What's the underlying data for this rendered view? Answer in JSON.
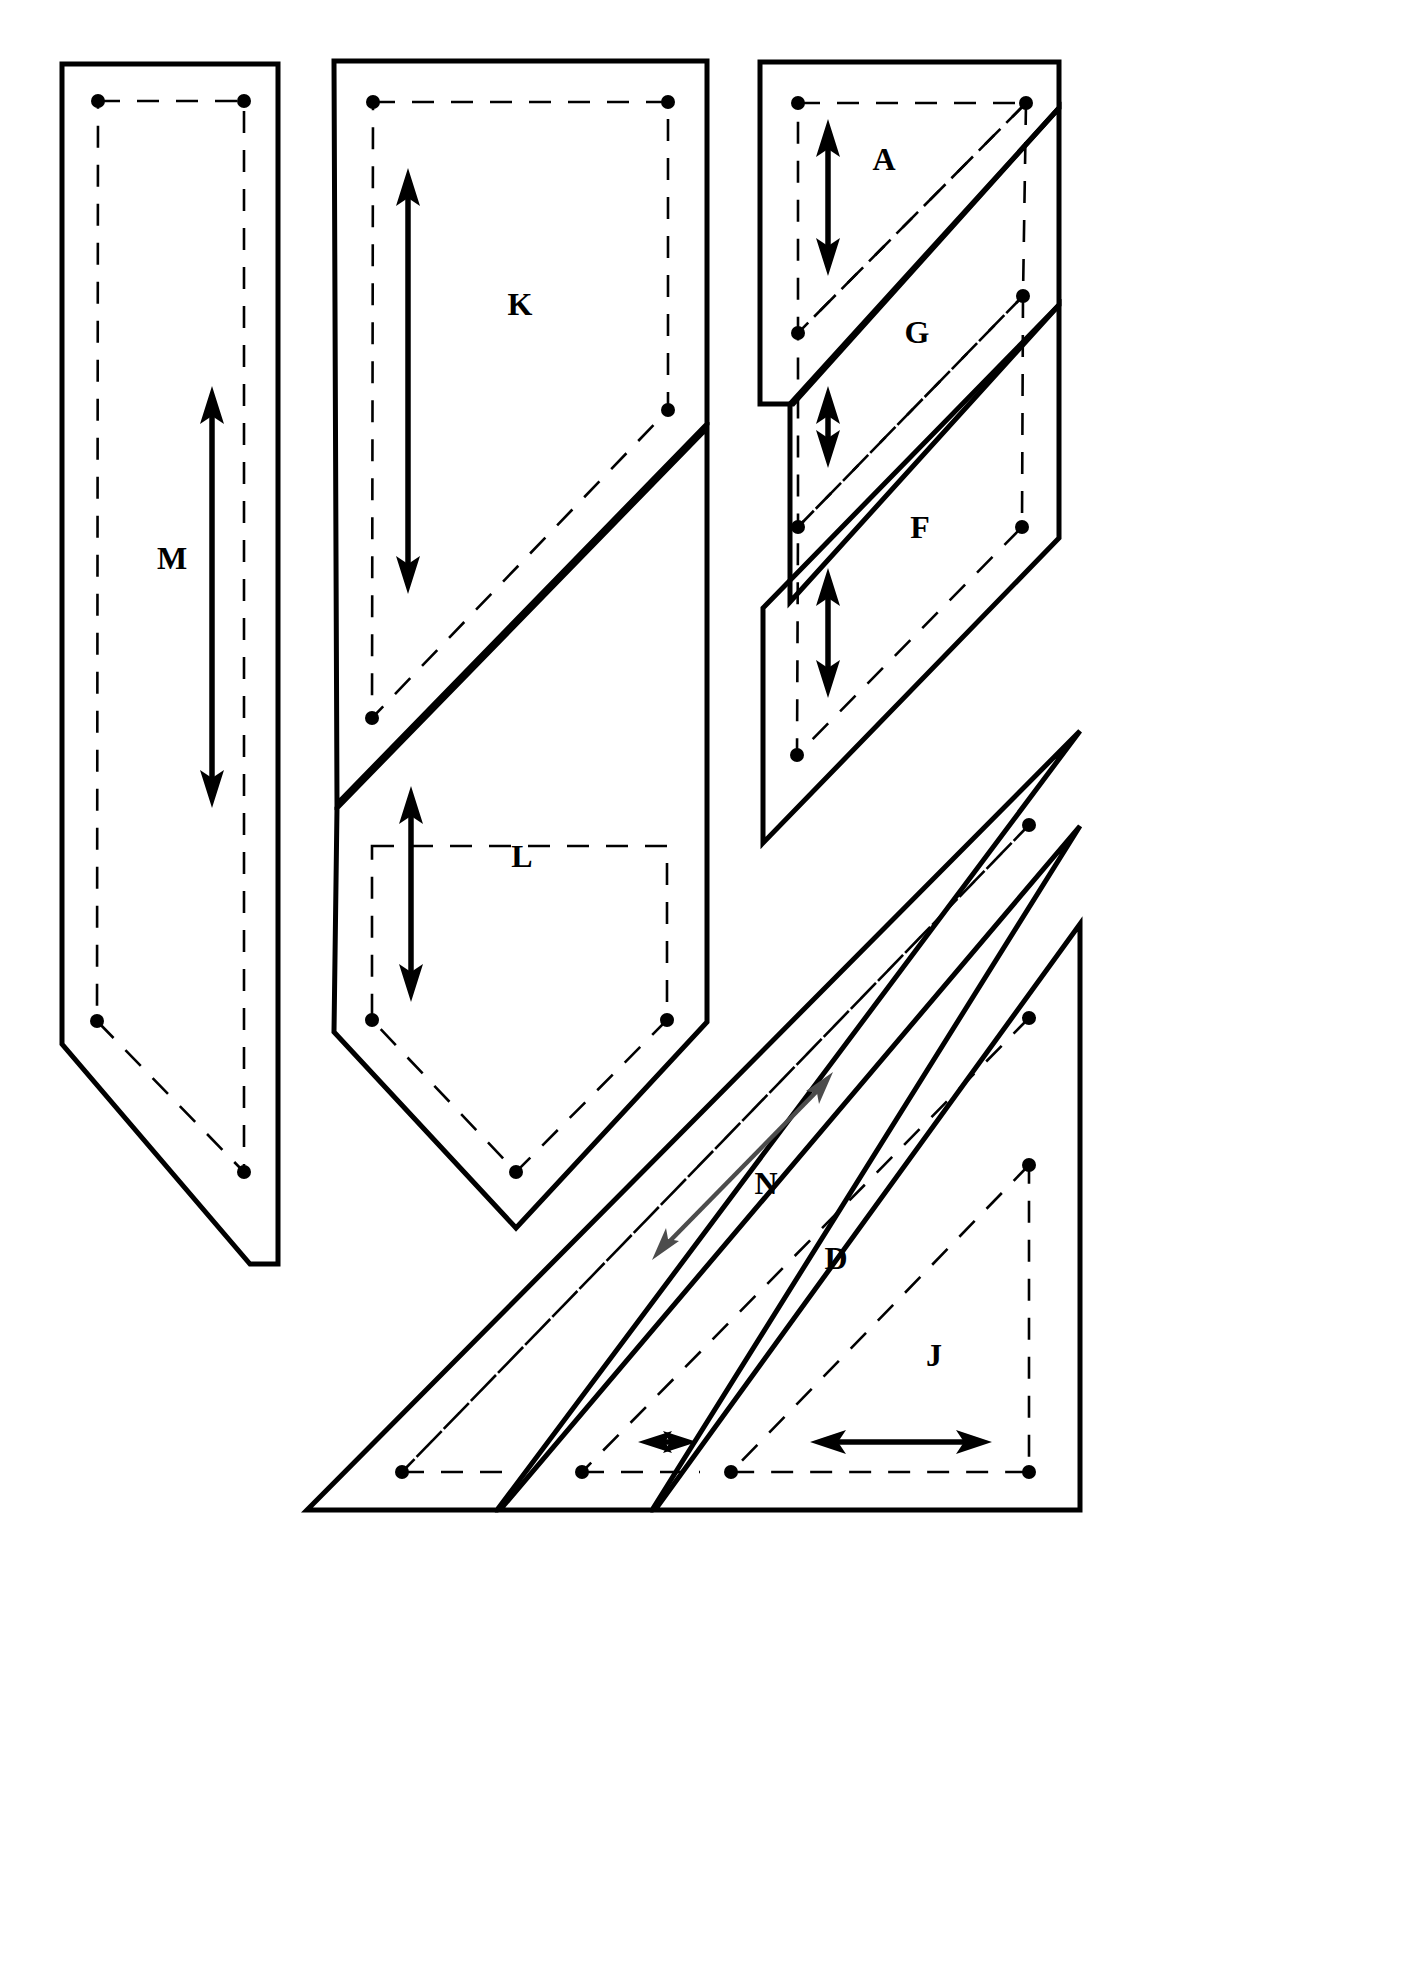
{
  "document": {
    "type": "sewing-pattern-sheet",
    "description": "Pattern piece layout sheet with cutting lines, dashed seam lines, pivot dots and grainline arrows",
    "background_color": "#ffffff",
    "ink_color": "#000000",
    "secondary_ink_color": "#4c4c4c"
  },
  "legend": {
    "cut_line": "solid heavy outline = cutting line",
    "seam_line": "dashed inner line = stitching / seam line",
    "dot": "filled circle = seam intersection / pivot point",
    "arrow": "double headed arrow = grainline direction"
  },
  "pieces": [
    {
      "id": "M",
      "label": "M",
      "label_x": 172,
      "label_y": 562,
      "group": "left-column",
      "grain": "vertical",
      "grain_arrow": {
        "x1": 212,
        "y1": 392,
        "x2": 212,
        "y2": 800,
        "heads": "both",
        "color": "#000000"
      }
    },
    {
      "id": "K",
      "label": "K",
      "label_x": 520,
      "label_y": 308,
      "group": "center-column",
      "grain": "vertical",
      "grain_arrow": {
        "x1": 408,
        "y1": 172,
        "x2": 408,
        "y2": 588,
        "heads": "both",
        "color": "#000000"
      }
    },
    {
      "id": "L",
      "label": "L",
      "label_x": 522,
      "label_y": 860,
      "group": "center-column",
      "grain": "vertical",
      "grain_arrow": {
        "x1": 411,
        "y1": 790,
        "x2": 411,
        "y2": 996,
        "heads": "both",
        "color": "#000000"
      }
    },
    {
      "id": "A",
      "label": "A",
      "label_x": 884,
      "label_y": 163,
      "group": "right-top-column",
      "grain": "vertical",
      "grain_arrow": {
        "x1": 828,
        "y1": 123,
        "x2": 828,
        "y2": 272,
        "heads": "both",
        "color": "#000000"
      }
    },
    {
      "id": "G",
      "label": "G",
      "label_x": 917,
      "label_y": 336,
      "group": "right-top-column",
      "grain": "vertical",
      "grain_arrow": {
        "x1": 828,
        "y1": 390,
        "x2": 828,
        "y2": 464,
        "heads": "both",
        "color": "#000000"
      }
    },
    {
      "id": "F",
      "label": "F",
      "label_x": 920,
      "label_y": 531,
      "group": "right-top-column",
      "grain": "vertical",
      "grain_arrow": {
        "x1": 828,
        "y1": 572,
        "x2": 828,
        "y2": 694,
        "heads": "both",
        "color": "#000000"
      }
    },
    {
      "id": "N",
      "label": "N",
      "label_x": 766,
      "label_y": 1187,
      "group": "bottom-right-triangles",
      "grain": "diagonal",
      "grain_arrow": {
        "x1": 654,
        "y1": 1257,
        "x2": 830,
        "y2": 1075,
        "heads": "both",
        "color": "#4c4c4c"
      }
    },
    {
      "id": "D",
      "label": "D",
      "label_x": 836,
      "label_y": 1262,
      "group": "bottom-right-triangles",
      "grain": "horizontal",
      "grain_arrow": {
        "x1": 643,
        "y1": 1442,
        "x2": 692,
        "y2": 1442,
        "heads": "both",
        "color": "#000000"
      }
    },
    {
      "id": "J",
      "label": "J",
      "label_x": 934,
      "label_y": 1359,
      "group": "bottom-right-triangles",
      "grain": "horizontal",
      "grain_arrow": {
        "x1": 816,
        "y1": 1442,
        "x2": 986,
        "y2": 1442,
        "heads": "both",
        "color": "#000000"
      }
    }
  ],
  "outlines": {
    "piece_M_cut": "M 62,64 L 278,64 L 278,1264 L 250,1264 L 62,1042 Z",
    "piece_M_seam": "M 98,101 L 244,101 L 244,1172 L 97,1021 Z",
    "piece_KL_cut_K": "M 334,61 L 707,61 L 707,424 L 337,804 L 334,61 Z",
    "piece_KL_cut_L": "M 337,806 L 707,426 L 707,1022 L 516,1228 L 334,1030 L 337,806 Z",
    "piece_K_seam": "M 373,102 L 668,102 L 668,410 L 372,718 Z",
    "piece_L_seam": "M 372,846 L 667,846 L 667,1020 L 516,1172 L 372,1020 Z",
    "piece_AGF_cut": "M 760,62 L 1059,62 L 1059,105 L 791,402 L 791,62 Z",
    "bottom_triangle_cut": "M 307,1510 L 1080,731 L 1080,1510 Z"
  },
  "dots": [
    {
      "x": 98,
      "y": 101
    },
    {
      "x": 244,
      "y": 101
    },
    {
      "x": 97,
      "y": 1021
    },
    {
      "x": 244,
      "y": 1172
    },
    {
      "x": 373,
      "y": 102
    },
    {
      "x": 668,
      "y": 102
    },
    {
      "x": 372,
      "y": 718
    },
    {
      "x": 668,
      "y": 410
    },
    {
      "x": 372,
      "y": 1020
    },
    {
      "x": 667,
      "y": 1020
    },
    {
      "x": 516,
      "y": 1172
    },
    {
      "x": 798,
      "y": 103
    },
    {
      "x": 1026,
      "y": 103
    },
    {
      "x": 798,
      "y": 333
    },
    {
      "x": 1023,
      "y": 296
    },
    {
      "x": 797,
      "y": 527
    },
    {
      "x": 1022,
      "y": 527
    },
    {
      "x": 797,
      "y": 755
    },
    {
      "x": 1029,
      "y": 825
    },
    {
      "x": 402,
      "y": 1472
    },
    {
      "x": 1029,
      "y": 1018
    },
    {
      "x": 582,
      "y": 1472
    },
    {
      "x": 1029,
      "y": 1165
    },
    {
      "x": 731,
      "y": 1472
    },
    {
      "x": 1029,
      "y": 1472
    }
  ]
}
